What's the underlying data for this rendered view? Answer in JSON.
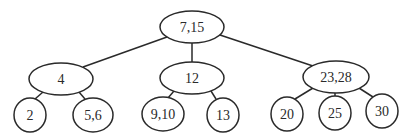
{
  "diagram": {
    "type": "tree",
    "colors": {
      "stroke": "#2a2a2a",
      "fill": "#ffffff",
      "text": "#2a2a2a"
    },
    "nodes": [
      {
        "id": "root",
        "label": "7,15",
        "cx": 192,
        "cy": 27,
        "rx": 32,
        "ry": 16
      },
      {
        "id": "n4",
        "label": "4",
        "cx": 61,
        "cy": 79,
        "rx": 32,
        "ry": 16
      },
      {
        "id": "n12",
        "label": "12",
        "cx": 192,
        "cy": 78,
        "rx": 32,
        "ry": 16
      },
      {
        "id": "n2328",
        "label": "23,28",
        "cx": 336,
        "cy": 77,
        "rx": 33,
        "ry": 16
      },
      {
        "id": "n2",
        "label": "2",
        "cx": 30,
        "cy": 115,
        "rx": 16,
        "ry": 17
      },
      {
        "id": "n56",
        "label": "5,6",
        "cx": 93,
        "cy": 115,
        "rx": 20,
        "ry": 17
      },
      {
        "id": "n910",
        "label": "9,10",
        "cx": 163,
        "cy": 114,
        "rx": 21,
        "ry": 17
      },
      {
        "id": "n13",
        "label": "13",
        "cx": 223,
        "cy": 115,
        "rx": 16,
        "ry": 17
      },
      {
        "id": "n20",
        "label": "20",
        "cx": 287,
        "cy": 114,
        "rx": 16,
        "ry": 17
      },
      {
        "id": "n25",
        "label": "25",
        "cx": 335,
        "cy": 113,
        "rx": 16,
        "ry": 17
      },
      {
        "id": "n30",
        "label": "30",
        "cx": 382,
        "cy": 111,
        "rx": 16,
        "ry": 17
      }
    ],
    "edges": [
      {
        "from": "root",
        "to": "n4",
        "x1": 167,
        "y1": 37,
        "x2": 83,
        "y2": 67
      },
      {
        "from": "root",
        "to": "n12",
        "x1": 192,
        "y1": 43,
        "x2": 192,
        "y2": 62
      },
      {
        "from": "root",
        "to": "n2328",
        "x1": 220,
        "y1": 35,
        "x2": 313,
        "y2": 66
      },
      {
        "from": "n4",
        "to": "n2",
        "x1": 43,
        "y1": 92,
        "x2": 35,
        "y2": 99
      },
      {
        "from": "n4",
        "to": "n56",
        "x1": 79,
        "y1": 92,
        "x2": 85,
        "y2": 99
      },
      {
        "from": "n12",
        "to": "n910",
        "x1": 174,
        "y1": 91,
        "x2": 168,
        "y2": 98
      },
      {
        "from": "n12",
        "to": "n13",
        "x1": 211,
        "y1": 91,
        "x2": 216,
        "y2": 99
      },
      {
        "from": "n2328",
        "to": "n20",
        "x1": 313,
        "y1": 88,
        "x2": 295,
        "y2": 99
      },
      {
        "from": "n2328",
        "to": "n25",
        "x1": 335,
        "y1": 93,
        "x2": 335,
        "y2": 96
      },
      {
        "from": "n2328",
        "to": "n30",
        "x1": 359,
        "y1": 88,
        "x2": 373,
        "y2": 97
      }
    ]
  }
}
